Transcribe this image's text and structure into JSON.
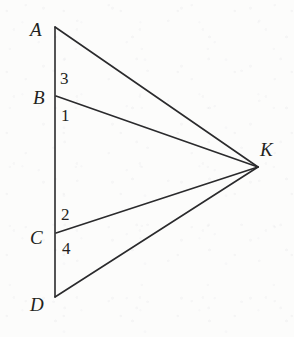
{
  "figure": {
    "canvas": {
      "width": 294,
      "height": 337
    },
    "background_color": "#fdfdfd",
    "stroke_color": "#2a2a2c",
    "text_color": "#231f20",
    "points": [
      {
        "id": "A",
        "label": "A",
        "x": 55,
        "y": 27,
        "label_x": 30,
        "label_y": 20
      },
      {
        "id": "B",
        "label": "B",
        "x": 56,
        "y": 96,
        "label_x": 33,
        "label_y": 88
      },
      {
        "id": "C",
        "label": "C",
        "x": 56,
        "y": 233,
        "label_x": 30,
        "label_y": 228
      },
      {
        "id": "D",
        "label": "D",
        "x": 55,
        "y": 297,
        "label_x": 30,
        "label_y": 295
      },
      {
        "id": "K",
        "label": "K",
        "x": 258,
        "y": 167,
        "label_x": 260,
        "label_y": 140
      }
    ],
    "segments": [
      {
        "id": "AD",
        "from": "A",
        "to": "D",
        "name": "segment-ad"
      },
      {
        "id": "AK",
        "from": "A",
        "to": "K",
        "name": "segment-ak"
      },
      {
        "id": "BK",
        "from": "B",
        "to": "K",
        "name": "segment-bk"
      },
      {
        "id": "CK",
        "from": "C",
        "to": "K",
        "name": "segment-ck"
      },
      {
        "id": "DK",
        "from": "D",
        "to": "K",
        "name": "segment-dk"
      }
    ],
    "angle_labels": [
      {
        "id": "angle-3",
        "text": "3",
        "x": 60,
        "y": 70,
        "at": "B",
        "note": "angle ABK above B"
      },
      {
        "id": "angle-1",
        "text": "1",
        "x": 61,
        "y": 107,
        "at": "B",
        "note": "angle KBD below B"
      },
      {
        "id": "angle-2",
        "text": "2",
        "x": 61,
        "y": 206,
        "at": "C",
        "note": "angle ACK above C"
      },
      {
        "id": "angle-4",
        "text": "4",
        "x": 62,
        "y": 240,
        "at": "C",
        "note": "angle KCD below C"
      }
    ]
  }
}
